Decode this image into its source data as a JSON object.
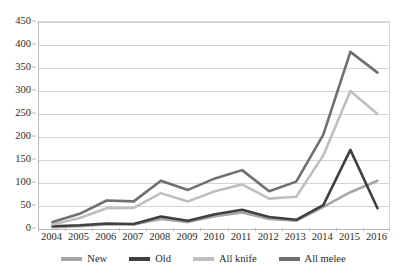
{
  "chart_data": {
    "type": "line",
    "title": "",
    "xlabel": "",
    "ylabel": "",
    "grid": true,
    "legend_position": "bottom",
    "ylim": [
      0,
      450
    ],
    "y_ticks": [
      0,
      50,
      100,
      150,
      200,
      250,
      300,
      350,
      400,
      450
    ],
    "categories": [
      "2004",
      "2005",
      "2006",
      "2007",
      "2008",
      "2009",
      "2010",
      "2011",
      "2012",
      "2013",
      "2014",
      "2015",
      "2016"
    ],
    "series": [
      {
        "name": "New",
        "color": "#a6a6a6",
        "values": [
          4,
          6,
          10,
          10,
          22,
          15,
          28,
          36,
          22,
          18,
          48,
          80,
          105
        ]
      },
      {
        "name": "Old",
        "color": "#404040",
        "values": [
          6,
          8,
          12,
          11,
          27,
          18,
          32,
          42,
          26,
          20,
          52,
          172,
          45
        ]
      },
      {
        "name": "All knife",
        "color": "#bfbfbf",
        "values": [
          10,
          24,
          45,
          46,
          78,
          60,
          82,
          97,
          66,
          70,
          160,
          300,
          250
        ]
      },
      {
        "name": "All melee",
        "color": "#707070",
        "values": [
          15,
          33,
          62,
          60,
          105,
          85,
          110,
          128,
          82,
          103,
          205,
          385,
          340
        ]
      }
    ]
  },
  "legend": {
    "items": [
      {
        "label": "New",
        "color": "#a6a6a6"
      },
      {
        "label": "Old",
        "color": "#404040"
      },
      {
        "label": "All knife",
        "color": "#bfbfbf"
      },
      {
        "label": "All melee",
        "color": "#707070"
      }
    ]
  }
}
